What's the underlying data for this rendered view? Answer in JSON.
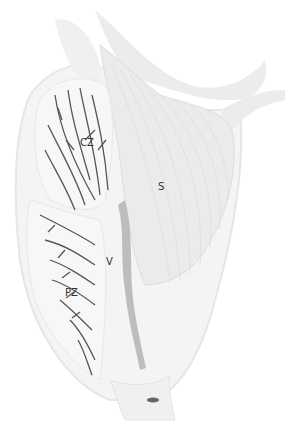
{
  "diagram": {
    "labels": [
      {
        "id": "cz",
        "text": "CZ",
        "x": 80,
        "y": 137
      },
      {
        "id": "s",
        "text": "S",
        "x": 158,
        "y": 181
      },
      {
        "id": "v",
        "text": "V",
        "x": 106,
        "y": 256
      },
      {
        "id": "pz",
        "text": "PZ",
        "x": 65,
        "y": 287
      }
    ],
    "colors": {
      "background": "#ffffff",
      "tissue": "#f1f1f1",
      "tissue_dark": "#e2e2e2",
      "stroma": "#e8e8e8",
      "ducts": "#555555",
      "urethra": "#bdbdbd",
      "label": "#333333"
    }
  }
}
